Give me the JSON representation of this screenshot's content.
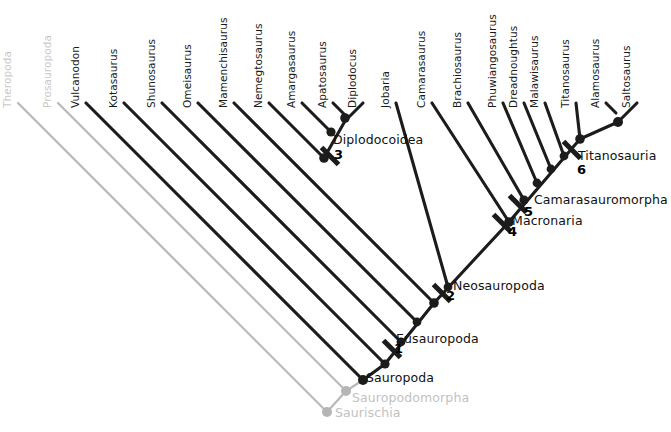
{
  "figure": {
    "kind": "cladogram",
    "width": 671,
    "height": 432,
    "background": "#ffffff",
    "colors": {
      "branch_dark": "#1c1c1c",
      "branch_faded": "#b9b9b9",
      "node_dark": "#1c1c1c",
      "node_faded": "#b5b5b5",
      "text_dark": "#111111",
      "text_faded": "#c4c4c4"
    }
  },
  "tips": [
    {
      "id": "theropoda",
      "label": "Theropoda",
      "faded": true,
      "x": 18,
      "y": 103,
      "label_x": 13,
      "label_y": 96
    },
    {
      "id": "prosauropoda",
      "label": "Prosauropoda",
      "faded": true,
      "x": 58,
      "y": 103,
      "label_x": 53,
      "label_y": 96
    },
    {
      "id": "vulcanodon",
      "label": "Vulcanodon",
      "faded": false,
      "x": 86,
      "y": 103,
      "label_x": 81,
      "label_y": 96
    },
    {
      "id": "kotasaurus",
      "label": "Kotasaurus",
      "faded": false,
      "x": 124,
      "y": 103,
      "label_x": 119,
      "label_y": 96
    },
    {
      "id": "shunosaurus",
      "label": "Shunosaurus",
      "faded": false,
      "x": 162,
      "y": 103,
      "label_x": 157,
      "label_y": 96
    },
    {
      "id": "omeisaurus",
      "label": "Omeisaurus",
      "faded": false,
      "x": 198,
      "y": 103,
      "label_x": 193,
      "label_y": 96
    },
    {
      "id": "mamenchisaurus",
      "label": "Mamenchisaurus",
      "faded": false,
      "x": 234,
      "y": 103,
      "label_x": 229,
      "label_y": 96
    },
    {
      "id": "nemegtosaurus",
      "label": "Nemegtosaurus",
      "faded": false,
      "x": 269,
      "y": 103,
      "label_x": 264,
      "label_y": 96
    },
    {
      "id": "amargasaurus",
      "label": "Amargasaurus",
      "faded": false,
      "x": 302,
      "y": 103,
      "label_x": 297,
      "label_y": 96
    },
    {
      "id": "apatosaurus",
      "label": "Apatosaurus",
      "faded": false,
      "x": 333,
      "y": 103,
      "label_x": 328,
      "label_y": 96
    },
    {
      "id": "diplodocus",
      "label": "Diplodocus",
      "faded": false,
      "x": 363,
      "y": 103,
      "label_x": 358,
      "label_y": 96
    },
    {
      "id": "jobaria",
      "label": "Jobaria",
      "faded": false,
      "x": 396,
      "y": 103,
      "label_x": 391,
      "label_y": 96
    },
    {
      "id": "camarasaurus",
      "label": "Camarasaurus",
      "faded": false,
      "x": 432,
      "y": 103,
      "label_x": 427,
      "label_y": 96
    },
    {
      "id": "brachiosaurus",
      "label": "Brachiosaurus",
      "faded": false,
      "x": 468,
      "y": 103,
      "label_x": 463,
      "label_y": 96
    },
    {
      "id": "phuwiangosaurus",
      "label": "Phuwiangosaurus",
      "faded": false,
      "x": 503,
      "y": 103,
      "label_x": 498,
      "label_y": 96
    },
    {
      "id": "dreadnoughtus",
      "label": "Dreadnoughtus",
      "faded": false,
      "x": 524,
      "y": 103,
      "label_x": 519,
      "label_y": 96
    },
    {
      "id": "malawisaurus",
      "label": "Malawisaurus",
      "faded": false,
      "x": 545,
      "y": 103,
      "label_x": 540,
      "label_y": 96
    },
    {
      "id": "titanosaurus",
      "label": "Titanosaurus",
      "faded": false,
      "x": 576,
      "y": 103,
      "label_x": 571,
      "label_y": 96
    },
    {
      "id": "alamosaurus",
      "label": "Alamosaurus",
      "faded": false,
      "x": 606,
      "y": 103,
      "label_x": 601,
      "label_y": 96
    },
    {
      "id": "saltosaurus",
      "label": "Saltosaurus",
      "faded": false,
      "x": 637,
      "y": 103,
      "label_x": 632,
      "label_y": 96
    }
  ],
  "branches": [
    {
      "id": "br-theropoda",
      "x1": 18,
      "y1": 103,
      "x2": 327,
      "y2": 412,
      "faded": true
    },
    {
      "id": "br-prosauropoda",
      "x1": 58,
      "y1": 103,
      "x2": 346,
      "y2": 391,
      "faded": true
    },
    {
      "id": "br-vulcanodon",
      "x1": 86,
      "y1": 103,
      "x2": 363,
      "y2": 380,
      "faded": false
    },
    {
      "id": "br-kotasaurus",
      "x1": 124,
      "y1": 103,
      "x2": 385,
      "y2": 364,
      "faded": false
    },
    {
      "id": "br-shunosaurus",
      "x1": 162,
      "y1": 103,
      "x2": 401,
      "y2": 342,
      "faded": false
    },
    {
      "id": "br-omeisaurus",
      "x1": 198,
      "y1": 103,
      "x2": 417,
      "y2": 322,
      "faded": false
    },
    {
      "id": "br-mamenchisaurus",
      "x1": 234,
      "y1": 103,
      "x2": 434,
      "y2": 303,
      "faded": false
    },
    {
      "id": "br-nemegtosaurus",
      "x1": 269,
      "y1": 103,
      "x2": 324,
      "y2": 158,
      "faded": false
    },
    {
      "id": "br-amargasaurus",
      "x1": 302,
      "y1": 103,
      "x2": 331,
      "y2": 132,
      "faded": false
    },
    {
      "id": "br-apatosaurus",
      "x1": 333,
      "y1": 103,
      "x2": 345,
      "y2": 115,
      "faded": false
    },
    {
      "id": "br-diplodocus",
      "x1": 363,
      "y1": 103,
      "x2": 345,
      "y2": 121,
      "faded": false
    },
    {
      "id": "br-jobaria",
      "x1": 396,
      "y1": 103,
      "x2": 448,
      "y2": 287,
      "faded": false
    },
    {
      "id": "br-camarasaurus",
      "x1": 432,
      "y1": 103,
      "x2": 509,
      "y2": 222,
      "faded": false
    },
    {
      "id": "br-brachiosaurus",
      "x1": 468,
      "y1": 103,
      "x2": 524,
      "y2": 200,
      "faded": false
    },
    {
      "id": "br-phuwiangosaurus",
      "x1": 503,
      "y1": 103,
      "x2": 537,
      "y2": 183,
      "faded": false
    },
    {
      "id": "br-dreadnoughtus",
      "x1": 524,
      "y1": 103,
      "x2": 551,
      "y2": 169,
      "faded": false
    },
    {
      "id": "br-malawisaurus",
      "x1": 545,
      "y1": 103,
      "x2": 564,
      "y2": 156,
      "faded": false
    },
    {
      "id": "br-titanosaurus",
      "x1": 576,
      "y1": 103,
      "x2": 580,
      "y2": 139,
      "faded": false
    },
    {
      "id": "br-alamosaurus",
      "x1": 606,
      "y1": 103,
      "x2": 616,
      "y2": 113,
      "faded": false
    },
    {
      "id": "br-saltosaurus",
      "x1": 637,
      "y1": 103,
      "x2": 618,
      "y2": 122,
      "faded": false
    },
    {
      "id": "br-spine-saurischia",
      "x1": 327,
      "y1": 412,
      "x2": 346,
      "y2": 391,
      "faded": true
    },
    {
      "id": "br-spine-sauropodomorpha",
      "x1": 346,
      "y1": 391,
      "x2": 363,
      "y2": 380,
      "faded": true
    },
    {
      "id": "br-spine-sauropoda",
      "x1": 363,
      "y1": 380,
      "x2": 385,
      "y2": 364,
      "faded": false
    },
    {
      "id": "br-spine-eusauropoda",
      "x1": 385,
      "y1": 364,
      "x2": 434,
      "y2": 303,
      "faded": false
    },
    {
      "id": "br-spine-neosauropoda",
      "x1": 434,
      "y1": 303,
      "x2": 509,
      "y2": 222,
      "faded": false
    },
    {
      "id": "br-spine-macronaria",
      "x1": 509,
      "y1": 222,
      "x2": 580,
      "y2": 139,
      "faded": false
    },
    {
      "id": "br-spine-titanosauria",
      "x1": 580,
      "y1": 139,
      "x2": 618,
      "y2": 122,
      "faded": false
    },
    {
      "id": "br-diplo-stem",
      "x1": 324,
      "y1": 158,
      "x2": 345,
      "y2": 121,
      "faded": false
    }
  ],
  "nodes": [
    {
      "id": "node-saurischia",
      "x": 327,
      "y": 412,
      "faded": true,
      "r": 5.0
    },
    {
      "id": "node-sauropodomorpha",
      "x": 346,
      "y": 391,
      "faded": true,
      "r": 5.0
    },
    {
      "id": "node-sauropoda",
      "x": 363,
      "y": 380,
      "faded": false,
      "r": 5.0
    },
    {
      "id": "node-eusauropoda",
      "x": 385,
      "y": 364,
      "faded": false,
      "r": 4.6
    },
    {
      "id": "node-e2",
      "x": 401,
      "y": 342,
      "faded": false,
      "r": 4.4
    },
    {
      "id": "node-e3",
      "x": 417,
      "y": 322,
      "faded": false,
      "r": 4.4
    },
    {
      "id": "node-neosauropoda",
      "x": 434,
      "y": 303,
      "faded": false,
      "r": 4.8
    },
    {
      "id": "node-diplo-base",
      "x": 324,
      "y": 158,
      "faded": false,
      "r": 4.8
    },
    {
      "id": "node-diplo-2",
      "x": 331,
      "y": 132,
      "faded": false,
      "r": 4.6
    },
    {
      "id": "node-diplo-3",
      "x": 345,
      "y": 118,
      "faded": false,
      "r": 4.8
    },
    {
      "id": "node-jobaria",
      "x": 448,
      "y": 287,
      "faded": false,
      "r": 4.4
    },
    {
      "id": "node-macronaria",
      "x": 509,
      "y": 222,
      "faded": false,
      "r": 4.8
    },
    {
      "id": "node-camarasauromorpha",
      "x": 524,
      "y": 200,
      "faded": false,
      "r": 4.6
    },
    {
      "id": "node-t1",
      "x": 537,
      "y": 183,
      "faded": false,
      "r": 4.4
    },
    {
      "id": "node-t2",
      "x": 551,
      "y": 169,
      "faded": false,
      "r": 4.4
    },
    {
      "id": "node-t3",
      "x": 564,
      "y": 156,
      "faded": false,
      "r": 4.4
    },
    {
      "id": "node-titanosauria",
      "x": 580,
      "y": 139,
      "faded": false,
      "r": 4.8
    },
    {
      "id": "node-salta",
      "x": 618,
      "y": 122,
      "faded": false,
      "r": 5.0
    }
  ],
  "tick_marks": [
    {
      "id": "tick-1",
      "x": 392,
      "y": 349,
      "faded": false
    },
    {
      "id": "tick-2",
      "x": 442,
      "y": 293,
      "faded": false
    },
    {
      "id": "tick-3",
      "x": 330,
      "y": 156,
      "faded": false
    },
    {
      "id": "tick-4",
      "x": 502,
      "y": 223,
      "faded": false
    },
    {
      "id": "tick-5",
      "x": 518,
      "y": 204,
      "faded": false
    },
    {
      "id": "tick-6",
      "x": 572,
      "y": 150,
      "faded": false
    }
  ],
  "clade_labels": [
    {
      "id": "diplodocoidea",
      "label": "Diplodocoidea",
      "x": 333,
      "y": 132,
      "faded": false
    },
    {
      "id": "titanosauria",
      "label": "Titanosauria",
      "x": 578,
      "y": 148,
      "faded": false
    },
    {
      "id": "camarasauromorpha",
      "label": "Camarasauromorpha",
      "x": 534,
      "y": 192,
      "faded": false
    },
    {
      "id": "macronaria",
      "label": "Macronaria",
      "x": 512,
      "y": 213,
      "faded": false
    },
    {
      "id": "neosauropoda",
      "label": "Neosauropoda",
      "x": 453,
      "y": 278,
      "faded": false
    },
    {
      "id": "eusauropoda",
      "label": "Eusauropoda",
      "x": 396,
      "y": 331,
      "faded": false
    },
    {
      "id": "sauropoda",
      "label": "Sauropoda",
      "x": 366,
      "y": 370,
      "faded": false
    },
    {
      "id": "sauropodomorpha",
      "label": "Sauropodomorpha",
      "x": 352,
      "y": 390,
      "faded": true
    },
    {
      "id": "saurischia",
      "label": "Saurischia",
      "x": 335,
      "y": 405,
      "faded": true
    }
  ],
  "node_numbers": [
    {
      "id": "num-1",
      "label": "1",
      "x": 394,
      "y": 341
    },
    {
      "id": "num-2",
      "label": "2",
      "x": 446,
      "y": 288
    },
    {
      "id": "num-3",
      "label": "3",
      "x": 334,
      "y": 147
    },
    {
      "id": "num-4",
      "label": "4",
      "x": 508,
      "y": 224
    },
    {
      "id": "num-5",
      "label": "5",
      "x": 524,
      "y": 204
    },
    {
      "id": "num-6",
      "label": "6",
      "x": 577,
      "y": 162
    }
  ]
}
